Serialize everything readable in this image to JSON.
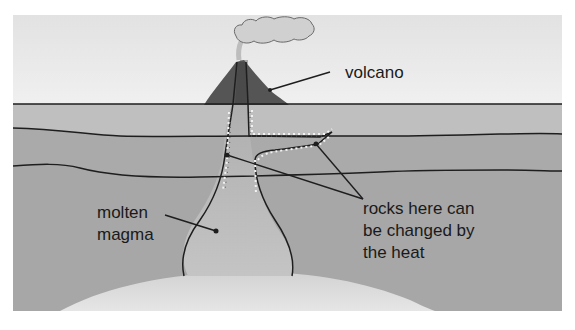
{
  "diagram": {
    "type": "cross-section",
    "labels": {
      "volcano": "volcano",
      "magma_line1": "molten",
      "magma_line2": "magma",
      "rocks_line1": "rocks here can",
      "rocks_line2": "be changed by",
      "rocks_line3": "the heat"
    },
    "colors": {
      "sky": "#e8e8e8",
      "layer_top": "#bfbfbf",
      "layer_middle": "#a9a9a9",
      "layer_bottom": "#a7a7a7",
      "magma": "#b4b4b4",
      "volcano": "#555555",
      "smoke": "#cfcfcf",
      "deep_dome": "#dcdcdc",
      "outline": "#1e1e1e",
      "heat_ticks": "#f2f2f2"
    }
  }
}
